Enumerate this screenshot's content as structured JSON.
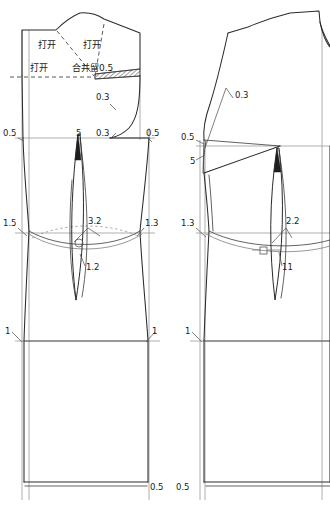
{
  "drawing": {
    "title": "Bodice sloper dart manipulation draft",
    "description": "Two-piece flat pattern technical drawing with dart rotation annotations",
    "stroke_color": "#2b2b2b",
    "construction_color": "#9a9a9a",
    "background": "#ffffff"
  },
  "front_piece": {
    "name": "front-bodice",
    "slash_labels": [
      {
        "text": "打开",
        "x": 38,
        "y": 48
      },
      {
        "text": "打开",
        "x": 83,
        "y": 48
      },
      {
        "text": "打开",
        "x": 30,
        "y": 68
      }
    ],
    "merge_label": {
      "text": "合并留0.5",
      "x": 72,
      "y": 70
    },
    "armhole_labels": [
      {
        "text": "0.3",
        "x": 96,
        "y": 100
      },
      {
        "text": "0.3",
        "x": 96,
        "y": 136
      }
    ],
    "bust_line_labels": [
      {
        "text": "0.5",
        "x": 3,
        "y": 136
      },
      {
        "text": "0.5",
        "x": 146,
        "y": 136
      }
    ],
    "dart_top_label": {
      "text": "5",
      "x": 76,
      "y": 136
    },
    "waist_labels": [
      {
        "text": "1.5",
        "x": 3,
        "y": 226
      },
      {
        "text": "3.2",
        "x": 90,
        "y": 224
      },
      {
        "text": "1.3",
        "x": 145,
        "y": 226
      }
    ],
    "dart_length_label": {
      "text": "1.2",
      "x": 86,
      "y": 268
    },
    "hip_labels": [
      {
        "text": "1",
        "x": 5,
        "y": 334
      },
      {
        "text": "1",
        "x": 152,
        "y": 334
      }
    ],
    "hem_label": {
      "text": "0.5",
      "x": 148,
      "y": 490
    }
  },
  "back_piece": {
    "name": "back-bodice",
    "armhole_label": {
      "text": "0.3",
      "x": 235,
      "y": 98
    },
    "shoulder_labels": [
      {
        "text": "0.5",
        "x": 183,
        "y": 138
      },
      {
        "text": "5",
        "x": 190,
        "y": 162
      }
    ],
    "waist_labels": [
      {
        "text": "1.3",
        "x": 182,
        "y": 226
      },
      {
        "text": "2.2",
        "x": 288,
        "y": 224
      }
    ],
    "dart_length_label": {
      "text": "11",
      "x": 283,
      "y": 268
    },
    "hip_label": {
      "text": "1",
      "x": 185,
      "y": 334
    },
    "hem_label": {
      "text": "0.5",
      "x": 176,
      "y": 490
    }
  },
  "markers": {
    "front_circle": {
      "name": "circle-notch",
      "cx": 79,
      "cy": 243,
      "r": 4
    },
    "back_square": {
      "name": "square-notch",
      "x": 260,
      "y": 247,
      "size": 7
    }
  }
}
